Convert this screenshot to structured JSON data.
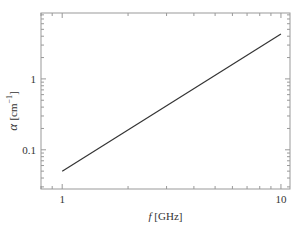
{
  "chart_data": {
    "type": "line",
    "title": "",
    "xlabel_var": "f",
    "xlabel_unit": "[GHz]",
    "ylabel_var": "α",
    "ylabel_unit": "[cm",
    "ylabel_exp": "−1",
    "ylabel_close": "]",
    "xscale": "log",
    "yscale": "log",
    "xlim": [
      0.8,
      11
    ],
    "ylim": [
      0.028,
      8.5
    ],
    "grid": false,
    "legend": null,
    "x_ticks": [
      {
        "value": 1,
        "label": "1"
      },
      {
        "value": 10,
        "label": "10"
      }
    ],
    "y_ticks": [
      {
        "value": 0.1,
        "label": "0.1"
      },
      {
        "value": 1,
        "label": "1"
      }
    ],
    "series": [
      {
        "name": "alpha",
        "x": [
          1,
          10
        ],
        "y": [
          0.05,
          4.3
        ],
        "color": "#333333"
      }
    ]
  }
}
